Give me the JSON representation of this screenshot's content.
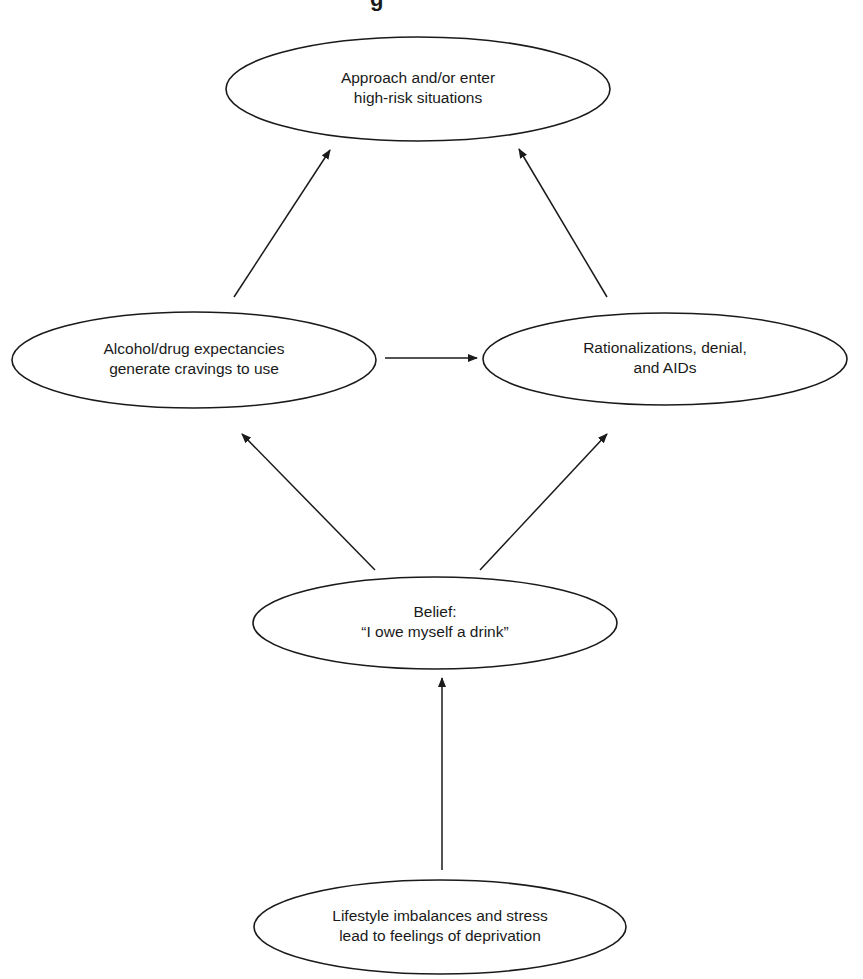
{
  "title_fragment": "g",
  "nodes": {
    "high_risk": {
      "lines": [
        "Approach and/or enter",
        "high-risk situations"
      ]
    },
    "expectancies": {
      "lines": [
        "Alcohol/drug expectancies",
        "generate cravings to use"
      ]
    },
    "rationalizations": {
      "lines": [
        "Rationalizations, denial,",
        "and AIDs"
      ]
    },
    "belief": {
      "lines": [
        "Belief:",
        "“I owe myself a drink”"
      ]
    },
    "lifestyle": {
      "lines": [
        "Lifestyle imbalances and stress",
        "lead to feelings of deprivation"
      ]
    }
  },
  "edges": [
    {
      "from": "lifestyle",
      "to": "belief"
    },
    {
      "from": "belief",
      "to": "expectancies"
    },
    {
      "from": "belief",
      "to": "rationalizations"
    },
    {
      "from": "expectancies",
      "to": "rationalizations"
    },
    {
      "from": "expectancies",
      "to": "high_risk"
    },
    {
      "from": "rationalizations",
      "to": "high_risk"
    }
  ],
  "colors": {
    "stroke": "#1a1a1a",
    "background": "#ffffff"
  }
}
